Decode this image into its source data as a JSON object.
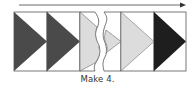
{
  "caption": "Make 4.",
  "colors": {
    "dark_gray": "#4a4a4a",
    "black": "#1e1e1e",
    "light_gray": "#dcdcdc",
    "outline": "#555555",
    "background": "#ffffff"
  },
  "arrow": {
    "direction": "right"
  },
  "units": [
    {
      "fill": "dark_gray",
      "shape": "flying-geese-triangle"
    },
    {
      "fill": "dark_gray",
      "shape": "flying-geese-triangle"
    },
    {
      "fill": "light_gray",
      "shape": "flying-geese-triangle-torn-right"
    },
    {
      "fill": "light_gray",
      "shape": "flying-geese-triangle-torn-left"
    },
    {
      "fill": "light_gray",
      "shape": "flying-geese-triangle"
    },
    {
      "fill": "black",
      "shape": "flying-geese-triangle"
    }
  ]
}
